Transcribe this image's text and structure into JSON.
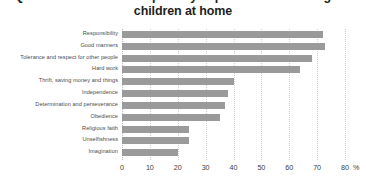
{
  "title": {
    "line1_clipped": "Qualities considered especially important to encourage in",
    "line2": "children at home"
  },
  "axis": {
    "unit": "%",
    "ticks": [
      "0",
      "10",
      "20",
      "30",
      "40",
      "50",
      "60",
      "70",
      "80"
    ],
    "tick_values": [
      0,
      10,
      20,
      30,
      40,
      50,
      60,
      70,
      80
    ],
    "xmin": 0,
    "xmax": 80
  },
  "colors": {
    "bar": "#9a9a9a",
    "gridline": "#cfcfcf",
    "label_text": "#4a4a4a",
    "tick_text": "#3c3c3c",
    "title_text": "#231f20",
    "background": "#ffffff"
  },
  "chart_data": {
    "type": "bar",
    "orientation": "horizontal",
    "title": "Qualities considered especially important to encourage in children at home",
    "xlabel": "%",
    "ylabel": "",
    "xlim": [
      0,
      80
    ],
    "grid": true,
    "legend": "none",
    "categories": [
      "Responsibility",
      "Good manners",
      "Tolerance and respect for other people",
      "Hard work",
      "Thrift, saving money and things",
      "Independence",
      "Determination and perseverance",
      "Obedience",
      "Religious faith",
      "Unselfishness",
      "Imagination"
    ],
    "values": [
      72,
      73,
      68,
      64,
      40,
      38,
      37,
      35,
      24,
      24,
      20
    ]
  }
}
